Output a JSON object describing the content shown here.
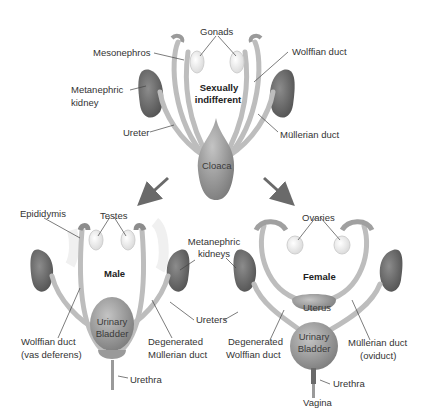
{
  "diagram": {
    "type": "anatomical-illustration",
    "colors": {
      "organ": "#8a8a8a",
      "duct": "#b8b8b8",
      "kidney": "#6e6e6e",
      "gonad": "#ececec",
      "arrow": "#6a6a6a",
      "text": "#333333"
    },
    "indifferent": {
      "title_line1": "Sexually",
      "title_line2": "indifferent",
      "labels": {
        "gonads": "Gonads",
        "mesonephros": "Mesonephros",
        "wolffian_duct": "Wolffian duct",
        "metanephric_kidney_line1": "Metanephric",
        "metanephric_kidney_line2": "kidney",
        "ureter": "Ureter",
        "mullerian_duct": "Müllerian duct",
        "cloaca": "Cloaca"
      }
    },
    "male": {
      "title": "Male",
      "labels": {
        "epididymis": "Epididymis",
        "testes": "Testes",
        "bladder_line1": "Urinary",
        "bladder_line2": "Bladder",
        "wolffian_line1": "Wolffian duct",
        "wolffian_line2": "(vas deferens)",
        "degen_line1": "Degenerated",
        "degen_line2": "Müllerian duct",
        "urethra": "Urethra"
      }
    },
    "shared": {
      "metanephric_kidneys_line1": "Metanephric",
      "metanephric_kidneys_line2": "kidneys",
      "ureters": "Ureters"
    },
    "female": {
      "title": "Female",
      "labels": {
        "ovaries": "Ovaries",
        "uterus": "Uterus",
        "bladder_line1": "Urinary",
        "bladder_line2": "Bladder",
        "degen_line1": "Degenerated",
        "degen_line2": "Wolffian duct",
        "mullerian_line1": "Müllerian duct",
        "mullerian_line2": "(oviduct)",
        "urethra": "Urethra",
        "vagina": "Vagina"
      }
    }
  }
}
